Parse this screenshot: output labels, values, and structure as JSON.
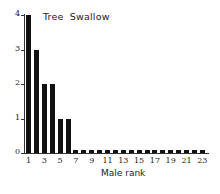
{
  "chart_data": {
    "type": "bar",
    "title": "Tree  Swallow",
    "xlabel": "Male rank",
    "ylabel": "",
    "categories": [
      1,
      2,
      3,
      4,
      5,
      6,
      7,
      8,
      9,
      10,
      11,
      12,
      13,
      14,
      15,
      16,
      17,
      18,
      19,
      20,
      21,
      22,
      23
    ],
    "values": [
      4,
      3,
      2,
      2,
      1,
      1,
      0.1,
      0.1,
      0.1,
      0.1,
      0.1,
      0.1,
      0.1,
      0.1,
      0.1,
      0.1,
      0.1,
      0.1,
      0.1,
      0.1,
      0.1,
      0.1,
      0.1
    ],
    "ylim": [
      0,
      4
    ],
    "yticks": [
      0,
      1,
      2,
      3,
      4
    ],
    "xticks": [
      1,
      3,
      5,
      7,
      9,
      11,
      13,
      15,
      17,
      19,
      21,
      23
    ],
    "grid": false,
    "bar_color": "#111111"
  }
}
